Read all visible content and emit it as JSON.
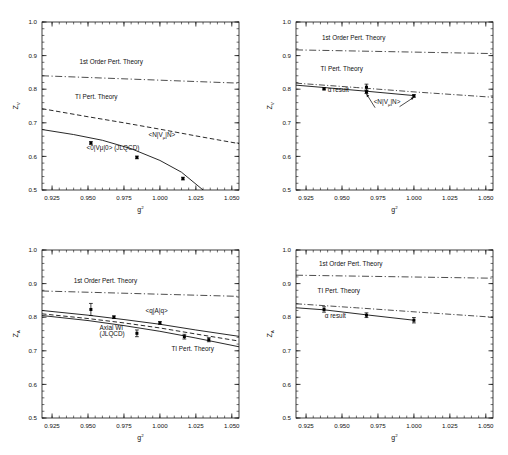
{
  "figure": {
    "background": "#ffffff",
    "line_color": "#111111",
    "marker_color": "#000000",
    "panel_count": 4
  },
  "axes": {
    "x_ticks": [
      "0.925",
      "0.950",
      "0.975",
      "1.000",
      "1.025",
      "1.050"
    ],
    "x_tick_values": [
      0.925,
      0.95,
      0.975,
      1.0,
      1.025,
      1.05
    ],
    "x_label_base": "g",
    "x_label_exp": "2",
    "y_ticks": [
      "0.5",
      "0.6",
      "0.7",
      "0.8",
      "0.9",
      "1.0"
    ],
    "y_tick_values": [
      0.5,
      0.6,
      0.7,
      0.8,
      0.9,
      1.0
    ],
    "y_label_base": "Z",
    "xlim": [
      0.918,
      1.055
    ],
    "ylim": [
      0.5,
      1.0
    ]
  },
  "labels": {
    "first_order": "1st Order Pert. Theory",
    "ti_pert": "TI Pert. Theory",
    "alpha_result": "α result",
    "jlqcd": "(JLQCD)",
    "axial_wi": "Axial WI",
    "vector_vac": "<0|V",
    "vector_vac_sub": "μ",
    "vector_vac_end": "|0>",
    "nucleon_v": "<N|V",
    "nucleon_v_sub": "μ",
    "nucleon_v_end": "|N>",
    "quark_a": "<q|A|q>",
    "zv_sub": "V",
    "za_sub": "A"
  },
  "chart_data": [
    {
      "id": "panel-top-left",
      "type": "line",
      "title": "",
      "xlabel": "g²",
      "ylabel": "Z_V",
      "xlim": [
        0.918,
        1.055
      ],
      "ylim": [
        0.5,
        1.0
      ],
      "grid": false,
      "legend": "none",
      "annotations": [
        {
          "text": "1st Order Pert. Theory",
          "x": 0.944,
          "y": 0.875
        },
        {
          "text": "TI Pert. Theory",
          "x": 0.941,
          "y": 0.772
        },
        {
          "text": "<0|Vμ|0> (JLQCD)",
          "x": 0.949,
          "y": 0.618
        },
        {
          "text": "<N|Vμ|N>",
          "x": 0.992,
          "y": 0.657
        }
      ],
      "series": [
        {
          "name": "1st Order Pert. Theory",
          "style": "dash-dot",
          "x": [
            0.918,
            1.055
          ],
          "values": [
            0.84,
            0.818
          ]
        },
        {
          "name": "TI Pert. Theory / <N|Vμ|N>",
          "style": "dashed",
          "x": [
            0.918,
            0.95,
            0.975,
            1.0,
            1.025,
            1.055
          ],
          "values": [
            0.742,
            0.718,
            0.7,
            0.681,
            0.661,
            0.638
          ]
        },
        {
          "name": "<0|Vμ|0> (JLQCD)",
          "style": "solid",
          "x": [
            0.918,
            0.94,
            0.96,
            0.98,
            1.0,
            1.015,
            1.03
          ],
          "values": [
            0.68,
            0.665,
            0.648,
            0.623,
            0.588,
            0.553,
            0.5
          ]
        }
      ],
      "points": {
        "name": "<0|Vμ|0> (JLQCD)",
        "x": [
          0.952,
          0.984,
          1.016
        ],
        "y": [
          0.64,
          0.597,
          0.534
        ],
        "yerr": [
          0.004,
          0.004,
          0.004
        ]
      }
    },
    {
      "id": "panel-top-right",
      "type": "line",
      "title": "",
      "xlabel": "g²",
      "ylabel": "Z_V",
      "xlim": [
        0.918,
        1.055
      ],
      "ylim": [
        0.5,
        1.0
      ],
      "grid": false,
      "legend": "none",
      "annotations": [
        {
          "text": "1st Order Pert. Theory",
          "x": 0.936,
          "y": 0.945
        },
        {
          "text": "TI Pert. Theory",
          "x": 0.935,
          "y": 0.855
        },
        {
          "text": "α result",
          "x": 0.94,
          "y": 0.792
        },
        {
          "text": "<N|Vμ|N>",
          "x": 0.972,
          "y": 0.755
        }
      ],
      "series": [
        {
          "name": "1st Order Pert. Theory",
          "style": "dash-dot",
          "x": [
            0.918,
            1.055
          ],
          "values": [
            0.917,
            0.906
          ]
        },
        {
          "name": "TI Pert. Theory",
          "style": "dash-dot-thin",
          "x": [
            0.918,
            0.96,
            1.0,
            1.055
          ],
          "values": [
            0.818,
            0.805,
            0.792,
            0.776
          ]
        },
        {
          "name": "α result",
          "style": "solid",
          "x": [
            0.918,
            0.9375,
            0.967,
            1.0
          ],
          "values": [
            0.812,
            0.805,
            0.794,
            0.781
          ]
        }
      ],
      "points": {
        "name": "α result / <N|Vμ|N>",
        "x": [
          0.9375,
          0.967,
          0.967,
          1.0
        ],
        "y": [
          0.801,
          0.806,
          0.792,
          0.78
        ],
        "yerr": [
          0.003,
          0.009,
          0.005,
          0.004
        ]
      },
      "arrows": [
        {
          "from_x": 0.973,
          "from_y": 0.745,
          "to_x": 0.967,
          "to_y": 0.786
        },
        {
          "from_x": 0.99,
          "from_y": 0.748,
          "to_x": 1.0,
          "to_y": 0.776
        }
      ]
    },
    {
      "id": "panel-bottom-left",
      "type": "line",
      "title": "",
      "xlabel": "g²",
      "ylabel": "Z_A",
      "xlim": [
        0.918,
        1.055
      ],
      "ylim": [
        0.5,
        1.0
      ],
      "grid": false,
      "legend": "none",
      "annotations": [
        {
          "text": "1st Order Pert. Theory",
          "x": 0.94,
          "y": 0.902
        },
        {
          "text": "<q|A|q>",
          "x": 0.99,
          "y": 0.812
        },
        {
          "text": "Axial WI",
          "x": 0.958,
          "y": 0.762
        },
        {
          "text": "(JLQCD)",
          "x": 0.958,
          "y": 0.745
        },
        {
          "text": "TI Pert. Theory",
          "x": 1.008,
          "y": 0.7
        }
      ],
      "series": [
        {
          "name": "1st Order Pert. Theory",
          "style": "dash-dot",
          "x": [
            0.918,
            1.055
          ],
          "values": [
            0.878,
            0.862
          ]
        },
        {
          "name": "<q|A|q>",
          "style": "solid",
          "x": [
            0.918,
            0.95,
            0.975,
            1.0,
            1.025,
            1.055
          ],
          "values": [
            0.82,
            0.806,
            0.793,
            0.779,
            0.762,
            0.743
          ]
        },
        {
          "name": "Axial WI (JLQCD)",
          "style": "dashed",
          "x": [
            0.918,
            0.95,
            0.975,
            1.0,
            1.025,
            1.055
          ],
          "values": [
            0.81,
            0.796,
            0.783,
            0.768,
            0.75,
            0.729
          ]
        },
        {
          "name": "TI Pert. Theory",
          "style": "solid-lower",
          "x": [
            0.918,
            0.95,
            0.975,
            1.0,
            1.025,
            1.055
          ],
          "values": [
            0.805,
            0.79,
            0.775,
            0.758,
            0.738,
            0.712
          ]
        }
      ],
      "points": {
        "name": "Axial WI (JLQCD)",
        "x": [
          0.952,
          0.968,
          0.984,
          1.0,
          1.017,
          1.034
        ],
        "y": [
          0.823,
          0.8,
          0.752,
          0.783,
          0.742,
          0.733
        ],
        "yerr": [
          0.018,
          0.004,
          0.01,
          0.004,
          0.007,
          0.006
        ]
      }
    },
    {
      "id": "panel-bottom-right",
      "type": "line",
      "title": "",
      "xlabel": "g²",
      "ylabel": "Z_A",
      "xlim": [
        0.918,
        1.055
      ],
      "ylim": [
        0.5,
        1.0
      ],
      "grid": false,
      "legend": "none",
      "annotations": [
        {
          "text": "1st Order Pert. Theory",
          "x": 0.934,
          "y": 0.952
        },
        {
          "text": "TI Pert. Theory",
          "x": 0.933,
          "y": 0.872
        },
        {
          "text": "α result",
          "x": 0.938,
          "y": 0.797
        }
      ],
      "series": [
        {
          "name": "1st Order Pert. Theory",
          "style": "dash-dot",
          "x": [
            0.918,
            1.055
          ],
          "values": [
            0.925,
            0.916
          ]
        },
        {
          "name": "TI Pert. Theory",
          "style": "dash-dot-thin",
          "x": [
            0.918,
            0.96,
            1.0,
            1.055
          ],
          "values": [
            0.84,
            0.828,
            0.816,
            0.8
          ]
        },
        {
          "name": "α result",
          "style": "solid",
          "x": [
            0.918,
            0.9375,
            0.967,
            1.0
          ],
          "values": [
            0.828,
            0.822,
            0.807,
            0.791
          ]
        }
      ],
      "points": {
        "name": "α result",
        "x": [
          0.9375,
          0.967,
          1.0
        ],
        "y": [
          0.823,
          0.806,
          0.791
        ],
        "yerr": [
          0.008,
          0.007,
          0.008
        ]
      }
    }
  ]
}
